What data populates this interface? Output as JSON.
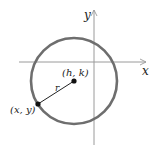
{
  "diagram": {
    "title": "",
    "axes": {
      "x_label": "x",
      "y_label": "y"
    },
    "circle": {
      "center_label": "(h, k)",
      "radius_label": "r",
      "point_label": "(x, y)"
    },
    "colors": {
      "circle": "#6e6e6e",
      "axis": "#9a9a9a",
      "point": "#111111"
    }
  }
}
